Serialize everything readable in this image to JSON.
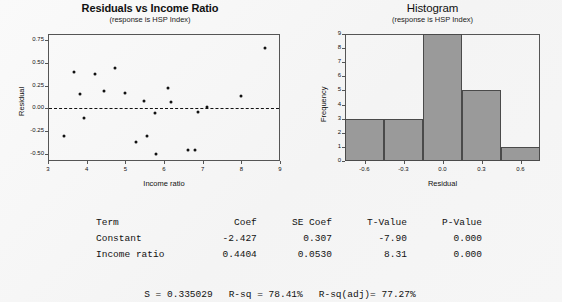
{
  "chart_data": [
    {
      "type": "scatter",
      "id": "residuals-vs-income-ratio",
      "title": "Residuals vs Income Ratio",
      "subtitle": "(response is HSP Index)",
      "xlabel": "Income ratio",
      "ylabel": "Residual",
      "xlim": [
        3,
        9
      ],
      "ylim": [
        -0.58,
        0.82
      ],
      "xticks": [
        3,
        4,
        5,
        6,
        7,
        8,
        9
      ],
      "xticklabels": [
        "3",
        "4",
        "5",
        "6",
        "7",
        "8",
        "9"
      ],
      "yticks": [
        -0.5,
        -0.25,
        0,
        0.25,
        0.5,
        0.75
      ],
      "yticklabels": [
        "-0.50",
        "-0.25",
        "0.00",
        "0.25",
        "0.50",
        "0.75"
      ],
      "grid": false,
      "reference_line": {
        "y": 0,
        "style": "dashed"
      },
      "points": [
        {
          "x": 3.42,
          "y": -0.3
        },
        {
          "x": 3.68,
          "y": 0.4
        },
        {
          "x": 3.82,
          "y": 0.16
        },
        {
          "x": 3.92,
          "y": -0.11
        },
        {
          "x": 4.22,
          "y": 0.38
        },
        {
          "x": 4.45,
          "y": 0.19
        },
        {
          "x": 4.72,
          "y": 0.44
        },
        {
          "x": 5.0,
          "y": 0.17
        },
        {
          "x": 5.28,
          "y": -0.37
        },
        {
          "x": 5.47,
          "y": 0.08
        },
        {
          "x": 5.55,
          "y": -0.3
        },
        {
          "x": 5.76,
          "y": -0.05
        },
        {
          "x": 5.8,
          "y": -0.5
        },
        {
          "x": 6.1,
          "y": 0.22
        },
        {
          "x": 6.18,
          "y": 0.07
        },
        {
          "x": 6.62,
          "y": -0.46
        },
        {
          "x": 6.8,
          "y": -0.46
        },
        {
          "x": 6.88,
          "y": -0.04
        },
        {
          "x": 7.1,
          "y": 0.02
        },
        {
          "x": 8.0,
          "y": 0.14
        },
        {
          "x": 8.62,
          "y": 0.67
        }
      ]
    },
    {
      "type": "bar",
      "id": "residual-histogram",
      "title": "Histogram",
      "subtitle": "(response is HSP Index)",
      "xlabel": "Residual",
      "ylabel": "Frequency",
      "xlim": [
        -0.75,
        0.75
      ],
      "ylim": [
        0,
        9
      ],
      "xticks": [
        -0.6,
        -0.3,
        0.0,
        0.3,
        0.6
      ],
      "xticklabels": [
        "-0.6",
        "-0.3",
        "0.0",
        "0.3",
        "0.6"
      ],
      "yticks": [
        0,
        1,
        2,
        3,
        4,
        5,
        6,
        7,
        8,
        9
      ],
      "yticklabels": [
        "0",
        "1",
        "2",
        "3",
        "4",
        "5",
        "6",
        "7",
        "8",
        "9"
      ],
      "grid": false,
      "bin_edges": [
        -0.75,
        -0.45,
        -0.15,
        0.15,
        0.45,
        0.75
      ],
      "bin_centers": [
        -0.6,
        -0.3,
        0.0,
        0.3,
        0.6
      ],
      "values": [
        3,
        3,
        9,
        5,
        1
      ],
      "bar_fill": "#9a9a9a",
      "bar_stroke": "#4a4a4a"
    }
  ],
  "stats": {
    "headers": {
      "term": "Term",
      "coef": "Coef",
      "se_coef": "SE Coef",
      "t_value": "T-Value",
      "p_value": "P-Value"
    },
    "rows": [
      {
        "term": "Constant",
        "coef": "-2.427",
        "se_coef": "0.307",
        "t_value": "-7.90",
        "p_value": "0.000"
      },
      {
        "term": "Income ratio",
        "coef": "0.4404",
        "se_coef": "0.0530",
        "t_value": "8.31",
        "p_value": "0.000"
      }
    ],
    "summary": {
      "s_label": "S = 0.335029",
      "rsq_label": "R-sq = 78.41%",
      "rsq_adj_label": "R-sq(adj)= 77.27%"
    }
  },
  "colors": {
    "background": "#f7f7f7",
    "axis": "#555555",
    "marker": "#111111",
    "bar_fill": "#9a9a9a",
    "bar_stroke": "#4a4a4a"
  }
}
